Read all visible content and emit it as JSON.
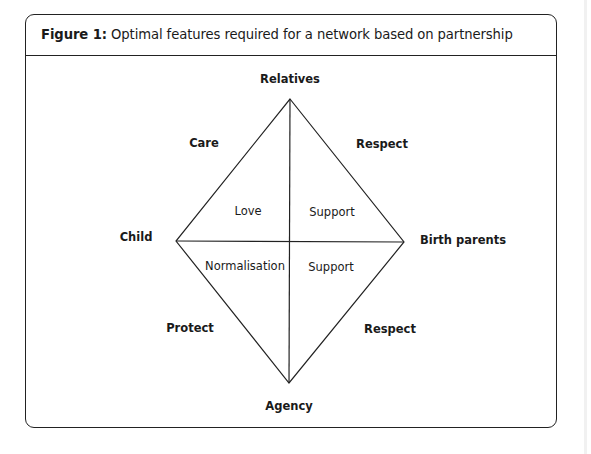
{
  "figure": {
    "number_label": "Figure 1:",
    "caption": "Optimal features required for a network based on partnership"
  },
  "diagram": {
    "vertices": {
      "top": "Relatives",
      "left": "Child",
      "right": "Birth parents",
      "bottom": "Agency"
    },
    "edges": {
      "top_left": "Care",
      "top_right": "Respect",
      "bottom_left": "Protect",
      "bottom_right": "Respect"
    },
    "quadrants": {
      "upper_left": "Love",
      "upper_right": "Support",
      "lower_left": "Normalisation",
      "lower_right": "Support"
    },
    "line_color": "#222222"
  }
}
